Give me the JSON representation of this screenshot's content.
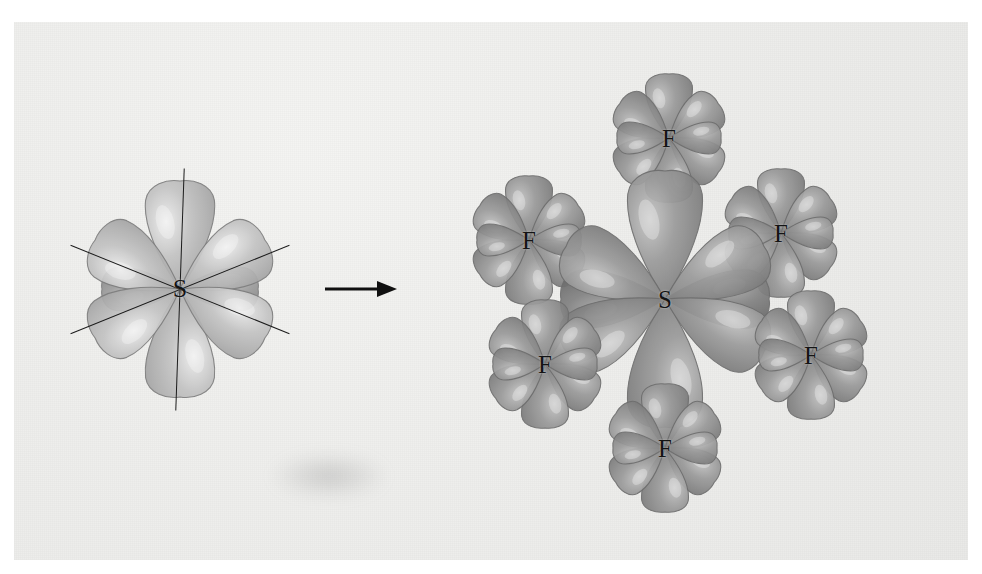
{
  "figure": {
    "background_color": "#eeeeec",
    "border_color": "#ffffff"
  },
  "arrow": {
    "name": "reaction-arrow",
    "x": 325,
    "y": 289,
    "length": 72,
    "color": "#101010"
  },
  "left_structure": {
    "name": "sulfur-hybrid-orbitals",
    "center": {
      "x": 180,
      "y": 289
    },
    "label": "S",
    "lobe_color": "#c3c3c3",
    "lobe_outline": "#7e7e7e",
    "lobe_count": 6,
    "lobes": [
      {
        "angle": -90,
        "length": 108,
        "width": 74,
        "depth": "front"
      },
      {
        "angle": 90,
        "length": 108,
        "width": 74,
        "depth": "front"
      },
      {
        "angle": 180,
        "length": 78,
        "width": 46,
        "depth": "back"
      },
      {
        "angle": 0,
        "length": 78,
        "width": 46,
        "depth": "back"
      },
      {
        "angle": -150,
        "length": 98,
        "width": 70,
        "depth": "front"
      },
      {
        "angle": -30,
        "length": 98,
        "width": 70,
        "depth": "front"
      },
      {
        "angle": 150,
        "length": 98,
        "width": 70,
        "depth": "front"
      },
      {
        "angle": 30,
        "length": 98,
        "width": 70,
        "depth": "front"
      }
    ],
    "axes": [
      {
        "name": "vertical-axis",
        "angle": 92,
        "length": 242
      },
      {
        "name": "diagonal-axis-1",
        "angle": 22,
        "length": 236
      },
      {
        "name": "diagonal-axis-2",
        "angle": -22,
        "length": 236
      }
    ]
  },
  "right_structure": {
    "name": "sulfur-hexafluoride-molecule",
    "formula": "SF6",
    "sulfur": {
      "label": "S",
      "x": 665,
      "y": 299
    },
    "sulfur_lobe_color": "#9b9b9b",
    "fluorine_lobe_color": "#9a9a9a",
    "lobe_outline": "#6e6e6e",
    "fluorines": [
      {
        "name": "fluorine-top",
        "label": "F",
        "x": 669,
        "y": 138,
        "lobes": 6,
        "scale": 1.0
      },
      {
        "name": "fluorine-upper-left",
        "label": "F",
        "x": 529,
        "y": 240,
        "lobes": 6,
        "scale": 1.0
      },
      {
        "name": "fluorine-upper-right",
        "label": "F",
        "x": 781,
        "y": 233,
        "lobes": 6,
        "scale": 1.0
      },
      {
        "name": "fluorine-lower-left",
        "label": "F",
        "x": 545,
        "y": 364,
        "lobes": 6,
        "scale": 1.0
      },
      {
        "name": "fluorine-lower-right",
        "label": "F",
        "x": 811,
        "y": 355,
        "lobes": 6,
        "scale": 1.0
      },
      {
        "name": "fluorine-bottom",
        "label": "F",
        "x": 665,
        "y": 448,
        "lobes": 6,
        "scale": 1.0
      }
    ],
    "sulfur_lobes": [
      {
        "angle": -90,
        "length": 128,
        "width": 80
      },
      {
        "angle": 90,
        "length": 128,
        "width": 80
      },
      {
        "angle": 180,
        "length": 104,
        "width": 62
      },
      {
        "angle": 0,
        "length": 104,
        "width": 62
      },
      {
        "angle": -152,
        "length": 112,
        "width": 70
      },
      {
        "angle": -28,
        "length": 112,
        "width": 70
      },
      {
        "angle": 152,
        "length": 112,
        "width": 70
      },
      {
        "angle": 28,
        "length": 112,
        "width": 70
      }
    ],
    "fluorine_lobe_template": [
      {
        "angle": -90,
        "length": 64,
        "width": 50
      },
      {
        "angle": -35,
        "length": 60,
        "width": 46
      },
      {
        "angle": 35,
        "length": 60,
        "width": 46
      },
      {
        "angle": 90,
        "length": 64,
        "width": 50
      },
      {
        "angle": 145,
        "length": 60,
        "width": 46
      },
      {
        "angle": -145,
        "length": 60,
        "width": 46
      },
      {
        "angle": 180,
        "length": 52,
        "width": 34
      },
      {
        "angle": 0,
        "length": 52,
        "width": 34
      }
    ]
  }
}
